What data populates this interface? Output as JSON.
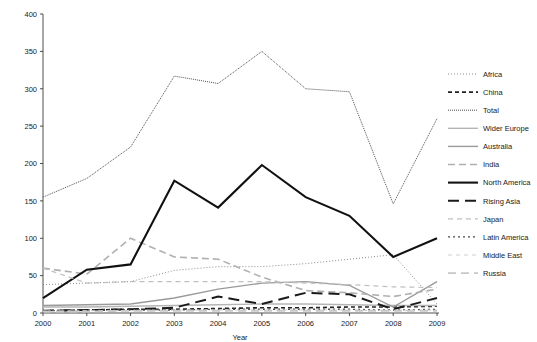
{
  "chart_data": {
    "type": "line",
    "title": "",
    "xlabel": "Year",
    "ylabel": "",
    "grid": false,
    "legend_position": "right",
    "x": [
      2000,
      2001,
      2002,
      2003,
      2004,
      2005,
      2006,
      2007,
      2008,
      2009
    ],
    "categories": [
      "2000",
      "2001",
      "2002",
      "2003",
      "2004",
      "2005",
      "2006",
      "2007",
      "2008",
      "2009"
    ],
    "xlim": [
      2000,
      2009
    ],
    "ylim": [
      0,
      400
    ],
    "ytick_labels": [
      "0",
      "50",
      "100",
      "150",
      "200",
      "250",
      "300",
      "350",
      "400"
    ],
    "yticks": [
      0,
      50,
      100,
      150,
      200,
      250,
      300,
      350,
      400
    ],
    "series": [
      {
        "name": "Africa",
        "color": "#8c8c8c",
        "width": 1.0,
        "dash": "1,2",
        "values": [
          38,
          40,
          42,
          57,
          62,
          62,
          66,
          72,
          78,
          12
        ]
      },
      {
        "name": "China",
        "color": "#222222",
        "width": 1.6,
        "dash": "4,3",
        "values": [
          3,
          4,
          5,
          5,
          6,
          7,
          7,
          8,
          8,
          9
        ]
      },
      {
        "name": "Total",
        "color": "#4d4d4d",
        "width": 1.0,
        "dash": "1,1",
        "values": [
          155,
          180,
          222,
          317,
          307,
          350,
          300,
          296,
          146,
          260
        ]
      },
      {
        "name": "Wider Europe",
        "color": "#b5b5b5",
        "width": 1.4,
        "dash": "none",
        "values": [
          8,
          8,
          9,
          10,
          11,
          12,
          12,
          11,
          10,
          10
        ]
      },
      {
        "name": "Australia",
        "color": "#9a9a9a",
        "width": 1.4,
        "dash": "none",
        "values": [
          10,
          11,
          12,
          20,
          32,
          40,
          42,
          37,
          8,
          42
        ]
      },
      {
        "name": "India",
        "color": "#b0b0b0",
        "width": 1.6,
        "dash": "7,4",
        "values": [
          60,
          52,
          100,
          75,
          72,
          48,
          30,
          27,
          22,
          32
        ]
      },
      {
        "name": "North America",
        "color": "#111111",
        "width": 2.1,
        "dash": "none",
        "values": [
          20,
          58,
          65,
          177,
          141,
          198,
          155,
          130,
          75,
          100
        ]
      },
      {
        "name": "Rising Asia",
        "color": "#1a1a1a",
        "width": 2.0,
        "dash": "11,6",
        "values": [
          3,
          4,
          5,
          7,
          22,
          12,
          27,
          25,
          5,
          20
        ]
      },
      {
        "name": "Japan",
        "color": "#c0c0c0",
        "width": 1.2,
        "dash": "5,4",
        "values": [
          60,
          40,
          42,
          42,
          42,
          42,
          40,
          38,
          35,
          34
        ]
      },
      {
        "name": "Latin America",
        "color": "#4a4a4a",
        "width": 1.3,
        "dash": "2,3",
        "values": [
          3,
          4,
          4,
          4,
          5,
          5,
          5,
          5,
          4,
          5
        ]
      },
      {
        "name": "Middle East",
        "color": "#cfcfcf",
        "width": 1.2,
        "dash": "4,4",
        "values": [
          2,
          3,
          3,
          4,
          4,
          4,
          4,
          4,
          3,
          4
        ]
      },
      {
        "name": "Russia",
        "color": "#c8c8c8",
        "width": 1.8,
        "dash": "8,5",
        "values": [
          2,
          2,
          3,
          3,
          3,
          3,
          3,
          3,
          3,
          3
        ]
      }
    ]
  },
  "axes": {
    "x_axis_title": "Year",
    "y_axis_title": ""
  }
}
